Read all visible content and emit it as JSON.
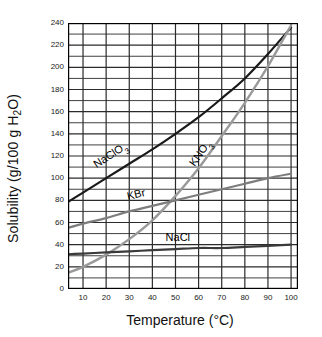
{
  "chart_data": {
    "type": "line",
    "title": "",
    "xlabel": "Temperature (°C)",
    "ylabel": "Solubility (g/100 g H₂O)",
    "xlim": [
      3.5,
      103
    ],
    "ylim": [
      0,
      240
    ],
    "xticks": [
      10,
      20,
      30,
      40,
      50,
      60,
      70,
      80,
      90,
      100
    ],
    "yticks": [
      0,
      20,
      40,
      60,
      80,
      100,
      120,
      140,
      160,
      180,
      200,
      220,
      240
    ],
    "x_minor_step": 10,
    "y_minor_step": 10,
    "grid": true,
    "legend": "inline-curve-labels",
    "x": [
      0,
      10,
      20,
      30,
      40,
      50,
      60,
      70,
      80,
      90,
      100
    ],
    "series": [
      {
        "name": "NaClO3",
        "label": "NaClO",
        "label_sub": "3",
        "color": "#1a1a1a",
        "width": 2.2,
        "values": [
          74,
          87,
          100,
          113,
          126,
          140,
          155,
          172,
          190,
          212,
          236
        ]
      },
      {
        "name": "KNO3",
        "label": "KNO",
        "label_sub": "3",
        "color": "#9a9a9a",
        "width": 2.4,
        "values": [
          12,
          20,
          31,
          45,
          62,
          84,
          109,
          138,
          168,
          201,
          238
        ]
      },
      {
        "name": "KBr",
        "label": "KBr",
        "label_sub": "",
        "color": "#7d7d7d",
        "width": 2.2,
        "values": [
          53,
          59,
          64,
          70,
          75,
          80,
          85,
          90,
          95,
          100,
          104
        ]
      },
      {
        "name": "NaCl",
        "label": "NaCl",
        "label_sub": "",
        "color": "#3a3a3a",
        "width": 2.2,
        "values": [
          31,
          32,
          33,
          34,
          35,
          36,
          37,
          37,
          38,
          39,
          40
        ]
      }
    ],
    "annotations": [
      {
        "text": "NaClO",
        "sub": "3",
        "x_data": 22,
        "y_data": 120,
        "rotation": -33
      },
      {
        "text": "KNO",
        "sub": "3",
        "x_data": 61,
        "y_data": 122,
        "rotation": -55
      },
      {
        "text": "KBr",
        "sub": "",
        "x_data": 33,
        "y_data": 86,
        "rotation": -13
      },
      {
        "text": "NaCl",
        "sub": "",
        "x_data": 51,
        "y_data": 47,
        "rotation": 0
      }
    ],
    "axis_color": "#000000",
    "grid_color": "#2b2b2b",
    "background": "#ffffff"
  }
}
